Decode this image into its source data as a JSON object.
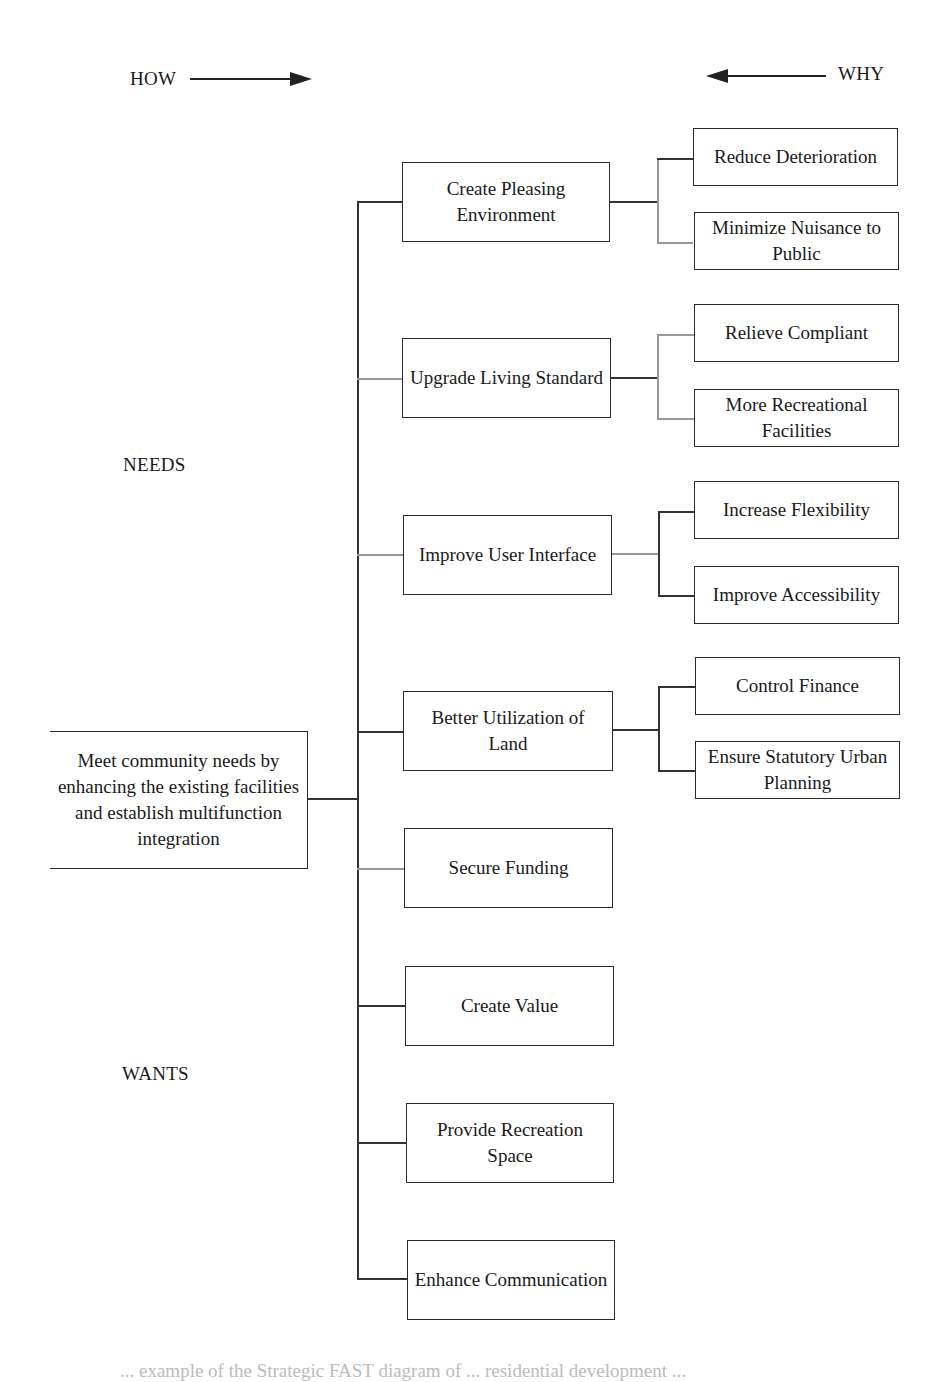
{
  "header": {
    "how_label": "HOW",
    "why_label": "WHY"
  },
  "side_labels": {
    "needs": "NEEDS",
    "wants": "WANTS"
  },
  "root": {
    "label": "Meet community needs by enhancing the existing facilities and establish multifunction integration"
  },
  "functions": [
    {
      "label": "Create Pleasing Environment",
      "children": [
        "Reduce Deterioration",
        "Minimize Nuisance to Public"
      ]
    },
    {
      "label": "Upgrade Living Standard",
      "children": [
        "Relieve Compliant",
        "More Recreational Facilities"
      ]
    },
    {
      "label": "Improve User Interface",
      "children": [
        "Increase Flexibility",
        "Improve Accessibility"
      ]
    },
    {
      "label": "Better Utilization of Land",
      "children": [
        "Control Finance",
        "Ensure Statutory Urban Planning"
      ]
    },
    {
      "label": "Secure Funding",
      "children": []
    },
    {
      "label": "Create Value",
      "children": []
    },
    {
      "label": "Provide Recreation Space",
      "children": []
    },
    {
      "label": "Enhance Communication",
      "children": []
    }
  ],
  "caption": "... example of the Strategic FAST diagram of ... residential development ..."
}
